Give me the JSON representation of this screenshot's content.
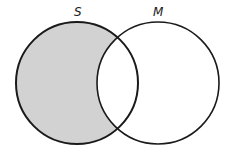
{
  "diagram": {
    "type": "venn",
    "sets": [
      {
        "label": "S",
        "shaded": "only-S"
      },
      {
        "label": "M",
        "shaded": "none"
      }
    ],
    "colors": {
      "shade": "#d2d2d2",
      "stroke": "#1a1a1a",
      "background": "#ffffff"
    }
  }
}
